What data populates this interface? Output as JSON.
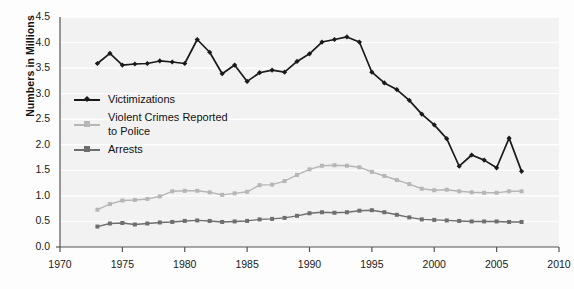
{
  "chart_data": {
    "type": "line",
    "title": "",
    "xlabel": "",
    "ylabel": "Numbers in Millions",
    "xlim": [
      1970,
      2010
    ],
    "ylim": [
      0.0,
      4.5
    ],
    "xticks": [
      1970,
      1975,
      1980,
      1985,
      1990,
      1995,
      2000,
      2005,
      2010
    ],
    "yticks": [
      "0.0",
      "0.5",
      "1.0",
      "1.5",
      "2.0",
      "2.5",
      "3.0",
      "3.5",
      "4.0",
      "4.5"
    ],
    "grid": "horizontal",
    "legend_position": "upper-left-inside",
    "x": [
      1973,
      1974,
      1975,
      1976,
      1977,
      1978,
      1979,
      1980,
      1981,
      1982,
      1983,
      1984,
      1985,
      1986,
      1987,
      1988,
      1989,
      1990,
      1991,
      1992,
      1993,
      1994,
      1995,
      1996,
      1997,
      1998,
      1999,
      2000,
      2001,
      2002,
      2003,
      2004,
      2005,
      2006,
      2007
    ],
    "series": [
      {
        "name": "Victimizations",
        "color": "#1a1a1a",
        "values": [
          3.59,
          3.79,
          3.56,
          3.58,
          3.59,
          3.64,
          3.62,
          3.59,
          4.06,
          3.81,
          3.39,
          3.56,
          3.24,
          3.41,
          3.46,
          3.42,
          3.63,
          3.78,
          4.01,
          4.06,
          4.11,
          4.01,
          3.42,
          3.21,
          3.08,
          2.87,
          2.6,
          2.39,
          2.12,
          1.58,
          1.8,
          1.7,
          1.55,
          2.13,
          1.48
        ]
      },
      {
        "name": "Violent Crimes Reported to Police",
        "color": "#b6b6b6",
        "values": [
          0.73,
          0.84,
          0.91,
          0.92,
          0.94,
          0.99,
          1.09,
          1.1,
          1.1,
          1.07,
          1.02,
          1.05,
          1.08,
          1.21,
          1.22,
          1.29,
          1.41,
          1.52,
          1.59,
          1.6,
          1.59,
          1.56,
          1.47,
          1.39,
          1.31,
          1.23,
          1.14,
          1.11,
          1.12,
          1.09,
          1.07,
          1.06,
          1.06,
          1.09,
          1.09
        ]
      },
      {
        "name": "Arrests",
        "color": "#6e6e6e",
        "values": [
          0.4,
          0.46,
          0.47,
          0.44,
          0.46,
          0.48,
          0.49,
          0.51,
          0.52,
          0.51,
          0.49,
          0.5,
          0.51,
          0.54,
          0.55,
          0.57,
          0.61,
          0.66,
          0.68,
          0.67,
          0.68,
          0.71,
          0.72,
          0.68,
          0.63,
          0.58,
          0.54,
          0.53,
          0.52,
          0.51,
          0.5,
          0.5,
          0.5,
          0.49,
          0.49
        ]
      }
    ]
  },
  "axes": {
    "y_title": "Numbers in Millions"
  },
  "legend": {
    "items": [
      {
        "label": "Victimizations",
        "label2": "",
        "color": "#1a1a1a"
      },
      {
        "label": "Violent Crimes Reported",
        "label2": "to Police",
        "color": "#b6b6b6"
      },
      {
        "label": "Arrests",
        "label2": "",
        "color": "#6e6e6e"
      }
    ]
  }
}
